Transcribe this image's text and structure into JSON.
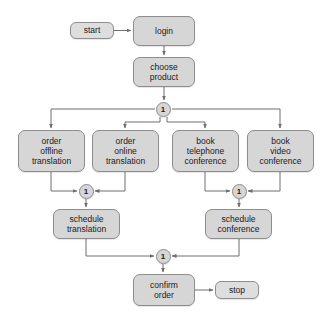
{
  "diagram": {
    "type": "activity-flowchart",
    "style": {
      "node_fill": "#d6d6d6",
      "terminal_fill": "#dedede",
      "node_border": "#8d8d8d",
      "edge_color": "#6f6f6f",
      "text_color": "#1a1a1a",
      "background": "#ffffff"
    },
    "nodes": [
      {
        "id": "start",
        "kind": "terminal",
        "lines": [
          "start"
        ],
        "x": 70,
        "y": 22,
        "w": 44,
        "h": 17
      },
      {
        "id": "login",
        "kind": "action",
        "lines": [
          "login"
        ],
        "x": 133,
        "y": 16,
        "w": 62,
        "h": 30
      },
      {
        "id": "choose-product",
        "kind": "action",
        "lines": [
          "choose",
          "product"
        ],
        "x": 133,
        "y": 57,
        "w": 62,
        "h": 30
      },
      {
        "id": "order-offline",
        "kind": "action",
        "lines": [
          "order",
          "offline",
          "translation"
        ],
        "x": 18,
        "y": 130,
        "w": 67,
        "h": 42
      },
      {
        "id": "order-online",
        "kind": "action",
        "lines": [
          "order",
          "online",
          "translation"
        ],
        "x": 92,
        "y": 130,
        "w": 67,
        "h": 42
      },
      {
        "id": "book-telephone",
        "kind": "action",
        "lines": [
          "book",
          "telephone",
          "conference"
        ],
        "x": 172,
        "y": 130,
        "w": 67,
        "h": 42
      },
      {
        "id": "book-video",
        "kind": "action",
        "lines": [
          "book",
          "video",
          "conference"
        ],
        "x": 247,
        "y": 130,
        "w": 67,
        "h": 42
      },
      {
        "id": "schedule-translation",
        "kind": "action",
        "lines": [
          "schedule",
          "translation"
        ],
        "x": 53,
        "y": 209,
        "w": 67,
        "h": 30
      },
      {
        "id": "schedule-conference",
        "kind": "action",
        "lines": [
          "schedule",
          "conference"
        ],
        "x": 205,
        "y": 209,
        "w": 67,
        "h": 30
      },
      {
        "id": "confirm-order",
        "kind": "action",
        "lines": [
          "confirm",
          "order"
        ],
        "x": 133,
        "y": 274,
        "w": 62,
        "h": 32
      },
      {
        "id": "stop",
        "kind": "terminal",
        "lines": [
          "stop"
        ],
        "x": 215,
        "y": 281,
        "w": 44,
        "h": 18
      }
    ],
    "control_points": [
      {
        "id": "fork-products",
        "label": "1",
        "cx": 163,
        "cy": 109
      },
      {
        "id": "merge-translation",
        "label": "1",
        "cx": 86,
        "cy": 191
      },
      {
        "id": "merge-conference",
        "label": "1",
        "cx": 239,
        "cy": 191
      },
      {
        "id": "merge-final",
        "label": "1",
        "cx": 163,
        "cy": 256
      }
    ],
    "edges": [
      {
        "from": "start",
        "to": "login"
      },
      {
        "from": "login",
        "to": "choose-product"
      },
      {
        "from": "choose-product",
        "to": "fork-products"
      },
      {
        "from": "fork-products",
        "to": "order-offline"
      },
      {
        "from": "fork-products",
        "to": "order-online"
      },
      {
        "from": "fork-products",
        "to": "book-telephone"
      },
      {
        "from": "fork-products",
        "to": "book-video"
      },
      {
        "from": "order-offline",
        "to": "merge-translation"
      },
      {
        "from": "order-online",
        "to": "merge-translation"
      },
      {
        "from": "book-telephone",
        "to": "merge-conference"
      },
      {
        "from": "book-video",
        "to": "merge-conference"
      },
      {
        "from": "merge-translation",
        "to": "schedule-translation"
      },
      {
        "from": "merge-conference",
        "to": "schedule-conference"
      },
      {
        "from": "schedule-translation",
        "to": "merge-final"
      },
      {
        "from": "schedule-conference",
        "to": "merge-final"
      },
      {
        "from": "merge-final",
        "to": "confirm-order"
      },
      {
        "from": "confirm-order",
        "to": "stop"
      }
    ]
  }
}
